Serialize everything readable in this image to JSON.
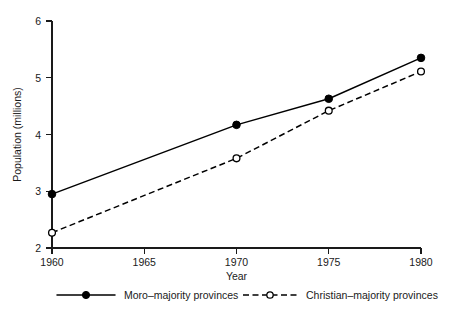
{
  "chart_data": {
    "type": "line",
    "title": "",
    "xlabel": "Year",
    "ylabel": "Population (millions)",
    "x": [
      1960,
      1970,
      1975,
      1980
    ],
    "xlim": [
      1960,
      1980
    ],
    "ylim": [
      2,
      6
    ],
    "xticks": [
      "1960",
      "1965",
      "1970",
      "1975",
      "1980"
    ],
    "xtick_values": [
      1960,
      1965,
      1970,
      1975,
      1980
    ],
    "yticks": [
      "2",
      "3",
      "4",
      "5",
      "6"
    ],
    "ytick_values": [
      2,
      3,
      4,
      5,
      6
    ],
    "grid": false,
    "legend_position": "below-axes",
    "series": [
      {
        "name": "Moro–majority provinces",
        "values": [
          2.95,
          4.17,
          4.63,
          5.35
        ],
        "line_style": "solid",
        "marker": "filled-circle",
        "color": "#000000"
      },
      {
        "name": "Christian–majority provinces",
        "values": [
          2.27,
          3.58,
          4.42,
          5.11
        ],
        "line_style": "dashed",
        "marker": "open-circle",
        "color": "#000000"
      }
    ]
  },
  "legend": {
    "items": [
      {
        "label": "Moro–majority provinces"
      },
      {
        "label": "Christian–majority provinces"
      }
    ]
  },
  "axes": {
    "x_title": "Year",
    "y_title": "Population (millions)",
    "x_tick_labels": [
      "1960",
      "1965",
      "1970",
      "1975",
      "1980"
    ],
    "y_tick_labels": [
      "2",
      "3",
      "4",
      "5",
      "6"
    ]
  }
}
